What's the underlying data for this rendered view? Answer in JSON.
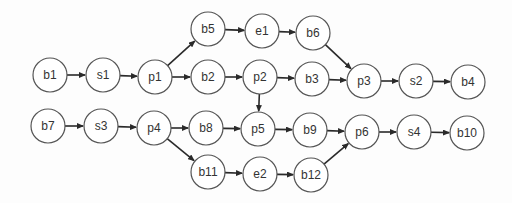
{
  "diagram": {
    "type": "directed-graph",
    "node_radius": 17,
    "nodes": [
      {
        "id": "b5",
        "label": "b5",
        "x": 208,
        "y": 29
      },
      {
        "id": "e1",
        "label": "e1",
        "x": 262,
        "y": 31
      },
      {
        "id": "b6",
        "label": "b6",
        "x": 313,
        "y": 33
      },
      {
        "id": "b1",
        "label": "b1",
        "x": 50,
        "y": 75
      },
      {
        "id": "s1",
        "label": "s1",
        "x": 103,
        "y": 75
      },
      {
        "id": "p1",
        "label": "p1",
        "x": 155,
        "y": 77
      },
      {
        "id": "b2",
        "label": "b2",
        "x": 208,
        "y": 77
      },
      {
        "id": "p2",
        "label": "p2",
        "x": 260,
        "y": 77
      },
      {
        "id": "b3",
        "label": "b3",
        "x": 312,
        "y": 79
      },
      {
        "id": "p3",
        "label": "p3",
        "x": 364,
        "y": 81
      },
      {
        "id": "s2",
        "label": "s2",
        "x": 416,
        "y": 81
      },
      {
        "id": "b4",
        "label": "b4",
        "x": 468,
        "y": 82
      },
      {
        "id": "b7",
        "label": "b7",
        "x": 48,
        "y": 126
      },
      {
        "id": "s3",
        "label": "s3",
        "x": 101,
        "y": 126
      },
      {
        "id": "p4",
        "label": "p4",
        "x": 154,
        "y": 128
      },
      {
        "id": "b8",
        "label": "b8",
        "x": 206,
        "y": 128
      },
      {
        "id": "p5",
        "label": "p5",
        "x": 258,
        "y": 129
      },
      {
        "id": "b9",
        "label": "b9",
        "x": 310,
        "y": 130
      },
      {
        "id": "p6",
        "label": "p6",
        "x": 362,
        "y": 132
      },
      {
        "id": "s4",
        "label": "s4",
        "x": 414,
        "y": 132
      },
      {
        "id": "b10",
        "label": "b10",
        "x": 467,
        "y": 133
      },
      {
        "id": "b11",
        "label": "b11",
        "x": 208,
        "y": 172
      },
      {
        "id": "e2",
        "label": "e2",
        "x": 260,
        "y": 174
      },
      {
        "id": "b12",
        "label": "b12",
        "x": 311,
        "y": 175
      }
    ],
    "edges": [
      {
        "from": "b1",
        "to": "s1"
      },
      {
        "from": "s1",
        "to": "p1"
      },
      {
        "from": "p1",
        "to": "b5"
      },
      {
        "from": "p1",
        "to": "b2"
      },
      {
        "from": "b5",
        "to": "e1"
      },
      {
        "from": "e1",
        "to": "b6"
      },
      {
        "from": "b6",
        "to": "p3"
      },
      {
        "from": "b2",
        "to": "p2"
      },
      {
        "from": "p2",
        "to": "b3"
      },
      {
        "from": "p2",
        "to": "p5"
      },
      {
        "from": "b3",
        "to": "p3"
      },
      {
        "from": "p3",
        "to": "s2"
      },
      {
        "from": "s2",
        "to": "b4"
      },
      {
        "from": "b7",
        "to": "s3"
      },
      {
        "from": "s3",
        "to": "p4"
      },
      {
        "from": "p4",
        "to": "b8"
      },
      {
        "from": "p4",
        "to": "b11"
      },
      {
        "from": "b8",
        "to": "p5"
      },
      {
        "from": "p5",
        "to": "b9"
      },
      {
        "from": "b9",
        "to": "p6"
      },
      {
        "from": "b11",
        "to": "e2"
      },
      {
        "from": "e2",
        "to": "b12"
      },
      {
        "from": "b12",
        "to": "p6"
      },
      {
        "from": "p6",
        "to": "s4"
      },
      {
        "from": "s4",
        "to": "b10"
      }
    ]
  }
}
